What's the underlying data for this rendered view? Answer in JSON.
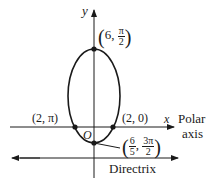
{
  "diagram": {
    "type": "polar conic (ellipse) with directrix",
    "axes": {
      "y_label": "y",
      "x_label": "x",
      "polar_axis_label_line1": "Polar",
      "polar_axis_label_line2": "axis",
      "origin_label": "O"
    },
    "points": {
      "top": {
        "r": "6",
        "theta_num": "π",
        "theta_den": "2"
      },
      "left": {
        "text": "(2, π)"
      },
      "right": {
        "text": "(2, 0)"
      },
      "bottom": {
        "r_num": "6",
        "r_den": "5",
        "theta_num": "3π",
        "theta_den": "2"
      }
    },
    "directrix_label": "Directrix",
    "colors": {
      "stroke": "#1a1a1a",
      "background": "#ffffff"
    }
  }
}
